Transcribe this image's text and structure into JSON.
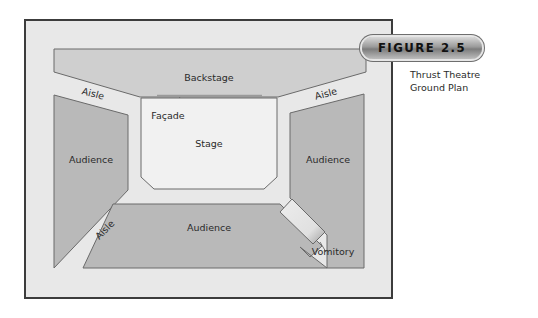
{
  "figure": {
    "badge": "FIGURE 2.5",
    "caption_line1": "Thrust Theatre",
    "caption_line2": "Ground Plan"
  },
  "plan": {
    "labels": {
      "backstage": "Backstage",
      "facade": "Façade",
      "stage": "Stage",
      "audience_left": "Audience",
      "audience_right": "Audience",
      "audience_bottom": "Audience",
      "aisle_top_left": "Aisle",
      "aisle_top_right": "Aisle",
      "aisle_bottom_left": "Aisle",
      "vomitory": "Vomitory"
    },
    "colors": {
      "frame_fill": "#e8e8e8",
      "frame_border": "#3c3c3c",
      "backstage_fill": "#cfcfcf",
      "audience_fill": "#b9b9b9",
      "stage_fill": "#f1f1f1",
      "outline": "#555555",
      "facade_line": "#9a9a9a"
    }
  }
}
